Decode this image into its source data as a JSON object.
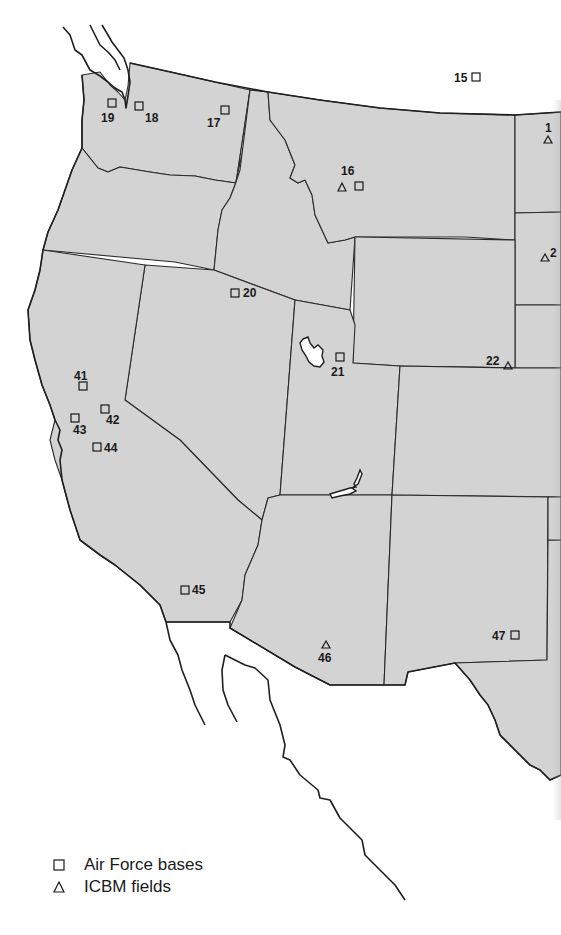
{
  "map": {
    "title": "",
    "region": "Western United States",
    "fill_color": "#d3d3d3",
    "border_color": "#2a2a2a"
  },
  "markers": [
    {
      "id": "19",
      "label": "19",
      "type": "air-force-base",
      "x": 112,
      "y": 103
    },
    {
      "id": "18",
      "label": "18",
      "type": "air-force-base",
      "x": 139,
      "y": 106
    },
    {
      "id": "17",
      "label": "17",
      "type": "air-force-base",
      "x": 225,
      "y": 110
    },
    {
      "id": "15",
      "label": "15",
      "type": "air-force-base",
      "x": 475,
      "y": 77
    },
    {
      "id": "16a",
      "label": "16",
      "type": "icbm-field",
      "x": 342,
      "y": 188
    },
    {
      "id": "16b",
      "label": "",
      "type": "air-force-base",
      "x": 359,
      "y": 186
    },
    {
      "id": "14",
      "label": "1",
      "type": "icbm-field",
      "x": 548,
      "y": 140
    },
    {
      "id": "2x",
      "label": "2",
      "type": "icbm-field",
      "x": 544,
      "y": 258
    },
    {
      "id": "20",
      "label": "20",
      "type": "air-force-base",
      "x": 236,
      "y": 293
    },
    {
      "id": "21",
      "label": "21",
      "type": "air-force-base",
      "x": 339,
      "y": 357
    },
    {
      "id": "22",
      "label": "22",
      "type": "icbm-field",
      "x": 508,
      "y": 366
    },
    {
      "id": "41",
      "label": "41",
      "type": "air-force-base",
      "x": 83,
      "y": 386
    },
    {
      "id": "42",
      "label": "42",
      "type": "air-force-base",
      "x": 105,
      "y": 409
    },
    {
      "id": "43",
      "label": "43",
      "type": "air-force-base",
      "x": 75,
      "y": 418
    },
    {
      "id": "44",
      "label": "44",
      "type": "air-force-base",
      "x": 97,
      "y": 447
    },
    {
      "id": "45",
      "label": "45",
      "type": "air-force-base",
      "x": 185,
      "y": 590
    },
    {
      "id": "46",
      "label": "46",
      "type": "icbm-field",
      "x": 326,
      "y": 645
    },
    {
      "id": "47",
      "label": "47",
      "type": "air-force-base",
      "x": 515,
      "y": 635
    }
  ],
  "labels": [
    {
      "text": "19",
      "x": 101,
      "y": 112
    },
    {
      "text": "18",
      "x": 145,
      "y": 112
    },
    {
      "text": "17",
      "x": 207,
      "y": 117
    },
    {
      "text": "15",
      "x": 454,
      "y": 72
    },
    {
      "text": "16",
      "x": 341,
      "y": 165
    },
    {
      "text": "1",
      "x": 545,
      "y": 122
    },
    {
      "text": "2",
      "x": 550,
      "y": 245
    },
    {
      "text": "20",
      "x": 243,
      "y": 287
    },
    {
      "text": "21",
      "x": 331,
      "y": 366
    },
    {
      "text": "22",
      "x": 486,
      "y": 355
    },
    {
      "text": "41",
      "x": 74,
      "y": 370
    },
    {
      "text": "42",
      "x": 106,
      "y": 414
    },
    {
      "text": "43",
      "x": 73,
      "y": 424
    },
    {
      "text": "44",
      "x": 104,
      "y": 442
    },
    {
      "text": "45",
      "x": 192,
      "y": 584
    },
    {
      "text": "46",
      "x": 318,
      "y": 652
    },
    {
      "text": "47",
      "x": 492,
      "y": 630
    }
  ],
  "legend": {
    "items": [
      {
        "symbol": "square",
        "label": "Air Force bases"
      },
      {
        "symbol": "triangle",
        "label": "ICBM fields"
      }
    ]
  }
}
